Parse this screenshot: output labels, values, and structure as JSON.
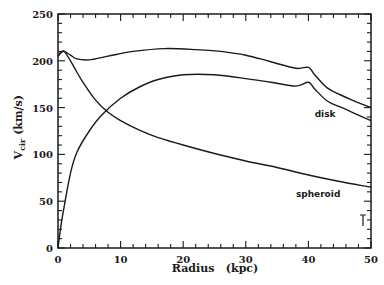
{
  "chart_data": {
    "type": "line",
    "title": "",
    "xlabel": "Radius   (kpc)",
    "ylabel": "V",
    "ylabel_sub": "cir",
    "ylabel_unit": "(km/s)",
    "xlim": [
      0,
      50
    ],
    "ylim": [
      0,
      250
    ],
    "x_ticks": [
      "0",
      "10",
      "20",
      "30",
      "40",
      "50"
    ],
    "y_ticks": [
      "0",
      "50",
      "100",
      "150",
      "200",
      "250"
    ],
    "grid": false,
    "legend": "none",
    "annotations": [
      {
        "text": "disk",
        "x": 41,
        "y": 140
      },
      {
        "text": "spheroid",
        "x": 38,
        "y": 55
      }
    ],
    "series": [
      {
        "name": "total",
        "x": [
          0,
          0.5,
          1,
          2,
          3,
          5,
          8,
          12,
          17,
          22,
          26,
          30,
          34,
          38,
          40,
          41,
          43,
          45,
          47,
          50
        ],
        "values": [
          205,
          209,
          210,
          206,
          202,
          201,
          205,
          210,
          213,
          212,
          210,
          206,
          199,
          192,
          193,
          185,
          171,
          164,
          158,
          150
        ]
      },
      {
        "name": "disk",
        "x": [
          0,
          0.5,
          1,
          2,
          3,
          5,
          7,
          10,
          13,
          16,
          20,
          25,
          30,
          34,
          38,
          40,
          41,
          43,
          45,
          47,
          50
        ],
        "values": [
          0,
          25,
          45,
          80,
          102,
          125,
          142,
          160,
          172,
          180,
          185,
          185,
          181,
          177,
          173,
          177,
          170,
          157,
          151,
          145,
          136
        ]
      },
      {
        "name": "spheroid",
        "x": [
          0,
          0.5,
          1,
          2,
          3,
          4,
          6,
          8,
          10,
          13,
          16,
          20,
          25,
          30,
          35,
          40,
          45,
          50
        ],
        "values": [
          205,
          209,
          210,
          200,
          188,
          177,
          158,
          145,
          136,
          126,
          118,
          110,
          101,
          93,
          86,
          78,
          71,
          65
        ]
      }
    ]
  }
}
